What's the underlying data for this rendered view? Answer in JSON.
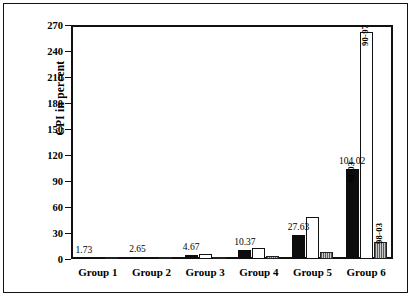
{
  "chart_data": {
    "type": "bar",
    "title": "",
    "xlabel": "",
    "ylabel": "CPI in percent",
    "ylim": [
      0,
      270
    ],
    "yticks": [
      0,
      30,
      60,
      90,
      120,
      150,
      180,
      210,
      240,
      270
    ],
    "grid": false,
    "legend": "none",
    "categories": [
      "Group 1",
      "Group 2",
      "Group 3",
      "Group 4",
      "Group 5",
      "Group 6"
    ],
    "series": [
      {
        "name": "90-03",
        "style": "black",
        "values": [
          1.73,
          2.65,
          4.67,
          10.37,
          27.63,
          104.02
        ]
      },
      {
        "name": "90-97",
        "style": "white",
        "values": [
          1.2,
          2.0,
          5.5,
          12.5,
          48.0,
          262.0
        ]
      },
      {
        "name": "98-03",
        "style": "gray",
        "values": [
          0.6,
          1.0,
          1.6,
          3.2,
          8.0,
          20.0
        ]
      }
    ],
    "data_labels": [
      "1.73",
      "2.65",
      "4.67",
      "10.37",
      "27.63",
      "104.02"
    ],
    "bar_annotations": {
      "black": "90-03",
      "white": "90-97",
      "gray": "98-03"
    }
  },
  "axis": {
    "y_title": "CPI in percent",
    "tick_labels": [
      "0",
      "30",
      "60",
      "90",
      "120",
      "150",
      "180",
      "210",
      "240",
      "270"
    ],
    "x_tick_labels": [
      "Group 1",
      "Group 2",
      "Group 3",
      "Group 4",
      "Group 5",
      "Group 6"
    ]
  }
}
